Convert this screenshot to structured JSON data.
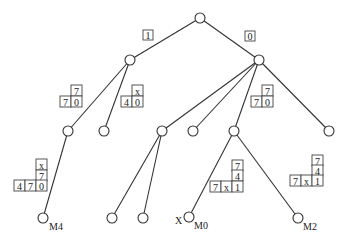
{
  "diagram": {
    "type": "tree",
    "colors": {
      "line": "#333333",
      "background": "#ffffff",
      "text": "#222222"
    },
    "nodes": [
      {
        "id": "root",
        "x": 200,
        "y": 18
      },
      {
        "id": "n1",
        "x": 130,
        "y": 60
      },
      {
        "id": "n0",
        "x": 259,
        "y": 60
      },
      {
        "id": "n1a",
        "x": 68,
        "y": 131
      },
      {
        "id": "n1b",
        "x": 104,
        "y": 131
      },
      {
        "id": "n0a",
        "x": 162,
        "y": 131
      },
      {
        "id": "n0b",
        "x": 193,
        "y": 131
      },
      {
        "id": "n0c",
        "x": 234,
        "y": 131
      },
      {
        "id": "n0d",
        "x": 329,
        "y": 131
      },
      {
        "id": "M4",
        "x": 43,
        "y": 218
      },
      {
        "id": "leafA",
        "x": 112,
        "y": 218
      },
      {
        "id": "leafB",
        "x": 143,
        "y": 218
      },
      {
        "id": "M0",
        "x": 189,
        "y": 217
      },
      {
        "id": "M2",
        "x": 298,
        "y": 218
      }
    ],
    "edges": [
      [
        "root",
        "n1"
      ],
      [
        "root",
        "n0"
      ],
      [
        "n1",
        "n1a"
      ],
      [
        "n1",
        "n1b"
      ],
      [
        "n0",
        "n0a"
      ],
      [
        "n0",
        "n0b"
      ],
      [
        "n0",
        "n0c"
      ],
      [
        "n0",
        "n0d"
      ],
      [
        "n1a",
        "M4"
      ],
      [
        "n0a",
        "leafA"
      ],
      [
        "n0a",
        "leafB"
      ],
      [
        "n0c",
        "M0"
      ],
      [
        "n0c",
        "M2"
      ]
    ],
    "edge_labels": [
      {
        "text": "1",
        "x": 143,
        "y": 30
      },
      {
        "text": "0",
        "x": 245,
        "y": 31
      }
    ],
    "box_groups": [
      {
        "id": "box-n1a",
        "cells": [
          {
            "text": "7",
            "x": 71,
            "y": 85
          },
          {
            "text": "7",
            "x": 60,
            "y": 96
          },
          {
            "text": "0",
            "x": 71,
            "y": 96
          }
        ]
      },
      {
        "id": "box-n1b",
        "cells": [
          {
            "text": "x",
            "x": 132,
            "y": 85
          },
          {
            "text": "4",
            "x": 121,
            "y": 96
          },
          {
            "text": "0",
            "x": 132,
            "y": 96
          }
        ]
      },
      {
        "id": "box-n0c",
        "cells": [
          {
            "text": "7",
            "x": 262,
            "y": 85
          },
          {
            "text": "7",
            "x": 251,
            "y": 96
          },
          {
            "text": "0",
            "x": 262,
            "y": 96
          }
        ]
      },
      {
        "id": "box-M4",
        "cells": [
          {
            "text": "x",
            "x": 36,
            "y": 159
          },
          {
            "text": "7",
            "x": 36,
            "y": 170
          },
          {
            "text": "4",
            "x": 14,
            "y": 180
          },
          {
            "text": "7",
            "x": 25,
            "y": 180
          },
          {
            "text": "0",
            "x": 36,
            "y": 180
          }
        ]
      },
      {
        "id": "box-M0",
        "cells": [
          {
            "text": "7",
            "x": 232,
            "y": 160
          },
          {
            "text": "4",
            "x": 232,
            "y": 170
          },
          {
            "text": "7",
            "x": 210,
            "y": 181
          },
          {
            "text": "x",
            "x": 221,
            "y": 181
          },
          {
            "text": "1",
            "x": 232,
            "y": 181
          }
        ]
      },
      {
        "id": "box-M2",
        "cells": [
          {
            "text": "7",
            "x": 312,
            "y": 155
          },
          {
            "text": "4",
            "x": 312,
            "y": 165
          },
          {
            "text": "7",
            "x": 290,
            "y": 175
          },
          {
            "text": "x",
            "x": 301,
            "y": 175
          },
          {
            "text": "1",
            "x": 312,
            "y": 175
          }
        ]
      }
    ],
    "leaf_labels": [
      {
        "text": "M4",
        "x": 49,
        "y": 230
      },
      {
        "text": "X",
        "x": 175,
        "y": 224
      },
      {
        "text": "M0",
        "x": 194,
        "y": 229
      },
      {
        "text": "M2",
        "x": 303,
        "y": 230
      }
    ],
    "cell_size": 11,
    "node_radius": 5
  }
}
